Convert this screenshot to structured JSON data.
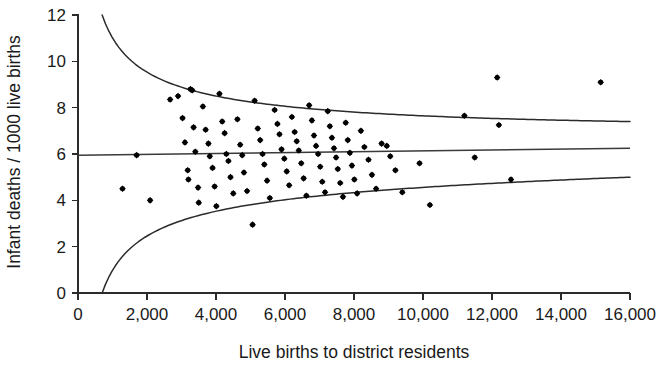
{
  "chart_data": {
    "type": "scatter",
    "title": "",
    "subtitle": "",
    "xlabel": "Live births to district residents",
    "ylabel": "Infant deaths / 1000 live births",
    "xlim": [
      0,
      16000
    ],
    "ylim": [
      0,
      12
    ],
    "xticks": [
      0,
      2000,
      4000,
      6000,
      8000,
      10000,
      12000,
      14000,
      16000
    ],
    "xtick_labels": [
      "0",
      "2,000",
      "4,000",
      "6,000",
      "8,000",
      "10,000",
      "12,000",
      "14,000",
      "16,000"
    ],
    "yticks": [
      0,
      2,
      4,
      6,
      8,
      10,
      12
    ],
    "ytick_labels": [
      "0",
      "2",
      "4",
      "6",
      "8",
      "10",
      "12"
    ],
    "grid": false,
    "legend": null,
    "annotations": [],
    "series": [
      {
        "name": "Districts",
        "marker": "filled-diamond",
        "color": "#000000",
        "points": [
          [
            1290,
            4.5
          ],
          [
            1700,
            5.95
          ],
          [
            2090,
            4.0
          ],
          [
            2670,
            8.35
          ],
          [
            2900,
            8.5
          ],
          [
            3030,
            7.55
          ],
          [
            3100,
            6.5
          ],
          [
            3180,
            5.3
          ],
          [
            3200,
            4.9
          ],
          [
            3260,
            8.8
          ],
          [
            3310,
            8.75
          ],
          [
            3350,
            7.15
          ],
          [
            3400,
            6.1
          ],
          [
            3480,
            4.55
          ],
          [
            3500,
            3.9
          ],
          [
            3620,
            8.05
          ],
          [
            3700,
            7.05
          ],
          [
            3780,
            6.45
          ],
          [
            3820,
            5.9
          ],
          [
            3900,
            5.4
          ],
          [
            3960,
            4.6
          ],
          [
            4010,
            3.75
          ],
          [
            4100,
            8.6
          ],
          [
            4180,
            7.4
          ],
          [
            4250,
            6.9
          ],
          [
            4300,
            6.0
          ],
          [
            4360,
            5.7
          ],
          [
            4420,
            5.0
          ],
          [
            4500,
            4.3
          ],
          [
            4620,
            7.5
          ],
          [
            4700,
            6.4
          ],
          [
            4760,
            5.95
          ],
          [
            4810,
            5.2
          ],
          [
            4900,
            4.4
          ],
          [
            5060,
            2.95
          ],
          [
            5120,
            8.3
          ],
          [
            5210,
            7.1
          ],
          [
            5280,
            6.6
          ],
          [
            5350,
            6.0
          ],
          [
            5400,
            5.55
          ],
          [
            5480,
            4.85
          ],
          [
            5560,
            4.1
          ],
          [
            5700,
            7.9
          ],
          [
            5780,
            7.3
          ],
          [
            5840,
            6.85
          ],
          [
            5900,
            6.2
          ],
          [
            5980,
            5.8
          ],
          [
            6050,
            5.25
          ],
          [
            6120,
            4.65
          ],
          [
            6200,
            7.6
          ],
          [
            6280,
            6.95
          ],
          [
            6340,
            6.55
          ],
          [
            6400,
            6.15
          ],
          [
            6470,
            5.6
          ],
          [
            6540,
            4.95
          ],
          [
            6620,
            4.2
          ],
          [
            6700,
            8.1
          ],
          [
            6780,
            7.45
          ],
          [
            6840,
            6.8
          ],
          [
            6900,
            6.35
          ],
          [
            6960,
            6.0
          ],
          [
            7020,
            5.45
          ],
          [
            7080,
            4.8
          ],
          [
            7160,
            4.35
          ],
          [
            7240,
            7.85
          ],
          [
            7300,
            7.2
          ],
          [
            7360,
            6.7
          ],
          [
            7420,
            6.25
          ],
          [
            7480,
            5.85
          ],
          [
            7530,
            5.35
          ],
          [
            7600,
            4.75
          ],
          [
            7680,
            4.15
          ],
          [
            7760,
            7.35
          ],
          [
            7820,
            6.6
          ],
          [
            7880,
            6.05
          ],
          [
            7940,
            5.5
          ],
          [
            8010,
            4.9
          ],
          [
            8090,
            4.3
          ],
          [
            8200,
            7.0
          ],
          [
            8300,
            6.3
          ],
          [
            8420,
            5.75
          ],
          [
            8520,
            5.1
          ],
          [
            8640,
            4.5
          ],
          [
            8800,
            6.45
          ],
          [
            8950,
            6.35
          ],
          [
            9050,
            5.9
          ],
          [
            9200,
            5.3
          ],
          [
            9400,
            4.35
          ],
          [
            9900,
            5.6
          ],
          [
            10200,
            3.8
          ],
          [
            11200,
            7.65
          ],
          [
            11500,
            5.85
          ],
          [
            12150,
            9.3
          ],
          [
            12200,
            7.25
          ],
          [
            12550,
            4.9
          ],
          [
            15150,
            9.1
          ]
        ]
      }
    ],
    "reference_lines": [
      {
        "name": "centre-line",
        "kind": "horizontal",
        "y_start": 5.95,
        "y_end": 6.25,
        "x_start": 0,
        "x_end": 16000
      }
    ],
    "control_limits": [
      {
        "name": "upper-limit",
        "kind": "funnel-upper",
        "y_at_x_start": 12.0,
        "y_at_x_end": 7.4,
        "x_start": 700,
        "x_end": 16000
      },
      {
        "name": "lower-limit",
        "kind": "funnel-lower",
        "y_at_x_start": 0.0,
        "y_at_x_end": 5.0,
        "x_start": 700,
        "x_end": 16000
      }
    ]
  }
}
